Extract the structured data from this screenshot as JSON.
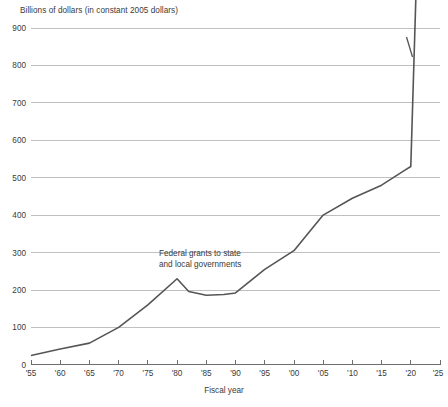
{
  "chart_data": {
    "type": "line",
    "title": "Billions of dollars (in constant 2005 dollars)",
    "xlabel": "Fiscal year",
    "ylabel": "",
    "series_name": "Federal grants to state and local governments",
    "annotations": [
      {
        "line1": "Federal grants to state",
        "line2": "and local governments"
      }
    ],
    "grid": true,
    "legend": "none",
    "xlim": [
      1955,
      2025
    ],
    "ylim": [
      0,
      900
    ],
    "y_ticks": [
      "0",
      "100",
      "200",
      "300",
      "400",
      "500",
      "600",
      "700",
      "800",
      "900"
    ],
    "y_tick_values": [
      0,
      100,
      200,
      300,
      400,
      500,
      600,
      700,
      800,
      900
    ],
    "x_ticks": [
      "'55",
      "'60",
      "'65",
      "'70",
      "'75",
      "'80",
      "'85",
      "'90",
      "'95",
      "'00",
      "'05",
      "'10",
      "'15",
      "'20",
      "'25"
    ],
    "x_tick_values": [
      1955,
      1960,
      1965,
      1970,
      1975,
      1980,
      1985,
      1990,
      1995,
      2000,
      2005,
      2010,
      2015,
      2020,
      2025
    ],
    "x": [
      1955,
      1960,
      1965,
      1970,
      1975,
      1980,
      1982,
      1985,
      1988,
      1990,
      1995,
      2000,
      2005,
      2010,
      2015,
      2019,
      2020,
      2021
    ],
    "values": [
      25,
      42,
      58,
      100,
      160,
      230,
      196,
      186,
      188,
      192,
      255,
      305,
      400,
      445,
      480,
      520,
      530,
      1050
    ],
    "spike_note": "final segment rises near-vertically past the top of the 900 axis",
    "colors": {
      "line": "#555555",
      "grid": "#b9b9b9",
      "axis": "#6d6d6d",
      "text": "#3a3a3a",
      "background": "#ffffff"
    }
  }
}
